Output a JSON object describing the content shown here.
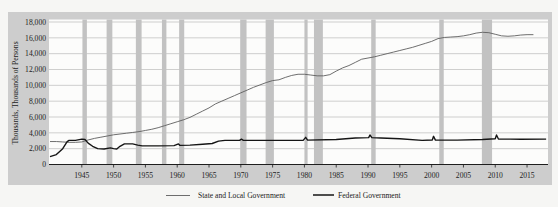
{
  "chart_data": {
    "type": "line",
    "title": "",
    "xlabel": "",
    "ylabel": "Thousands, Thousands of Persons",
    "xlim": [
      1940,
      2018.2
    ],
    "ylim": [
      0,
      18000
    ],
    "xticks": [
      1945,
      1950,
      1955,
      1960,
      1965,
      1970,
      1975,
      1980,
      1985,
      1990,
      1995,
      2000,
      2005,
      2010,
      2015
    ],
    "xtick_labels": [
      "1945",
      "1950",
      "1955",
      "1960",
      "1965",
      "1970",
      "1975",
      "1980",
      "1985",
      "1990",
      "1995",
      "2000",
      "2005",
      "2010",
      "2015"
    ],
    "yticks": [
      0,
      2000,
      4000,
      6000,
      8000,
      10000,
      12000,
      14000,
      16000,
      18000
    ],
    "ytick_labels": [
      "0",
      "2,000",
      "4,000",
      "6,000",
      "8,000",
      "10,000",
      "12,000",
      "14,000",
      "16,000",
      "18,000"
    ],
    "grid": "horizontal",
    "legend_position": "bottom",
    "shaded_bands": [
      [
        1945.1,
        1945.8
      ],
      [
        1948.9,
        1949.8
      ],
      [
        1953.5,
        1954.4
      ],
      [
        1957.6,
        1958.3
      ],
      [
        1960.3,
        1961.1
      ],
      [
        1969.9,
        1970.9
      ],
      [
        1973.9,
        1975.2
      ],
      [
        1980.0,
        1980.5
      ],
      [
        1981.5,
        1982.9
      ],
      [
        1990.5,
        1991.2
      ],
      [
        2001.2,
        2001.9
      ],
      [
        2007.9,
        2009.5
      ]
    ],
    "series": [
      {
        "name": "State and Local Government",
        "color": "#5e5e5e",
        "x": [
          1940,
          1941,
          1942,
          1943,
          1944,
          1945,
          1946,
          1947,
          1948,
          1949,
          1950,
          1951,
          1952,
          1953,
          1954,
          1955,
          1956,
          1957,
          1958,
          1959,
          1960,
          1961,
          1962,
          1963,
          1964,
          1965,
          1966,
          1967,
          1968,
          1969,
          1970,
          1971,
          1972,
          1973,
          1974,
          1975,
          1976,
          1977,
          1978,
          1979,
          1980,
          1981,
          1982,
          1983,
          1984,
          1985,
          1986,
          1987,
          1988,
          1989,
          1990,
          1991,
          1992,
          1993,
          1994,
          1995,
          1996,
          1997,
          1998,
          1999,
          2000,
          2001,
          2002,
          2003,
          2004,
          2005,
          2006,
          2007,
          2008,
          2009,
          2010,
          2011,
          2012,
          2013,
          2014,
          2015,
          2016
        ],
        "values": [
          2900,
          2900,
          2850,
          2800,
          2800,
          2850,
          3100,
          3300,
          3450,
          3600,
          3750,
          3850,
          3950,
          4050,
          4150,
          4300,
          4450,
          4650,
          4900,
          5150,
          5400,
          5650,
          5950,
          6350,
          6750,
          7150,
          7650,
          8000,
          8350,
          8700,
          9050,
          9400,
          9750,
          10050,
          10350,
          10600,
          10700,
          11000,
          11250,
          11400,
          11400,
          11300,
          11200,
          11200,
          11350,
          11800,
          12200,
          12500,
          12900,
          13300,
          13450,
          13600,
          13800,
          14000,
          14200,
          14400,
          14600,
          14800,
          15050,
          15300,
          15550,
          15900,
          16050,
          16100,
          16150,
          16250,
          16400,
          16600,
          16700,
          16650,
          16450,
          16250,
          16200,
          16250,
          16350,
          16400,
          16400
        ]
      },
      {
        "name": "Federal Government",
        "color": "#151515",
        "x": [
          1940,
          1941,
          1942,
          1942.7,
          1943,
          1944,
          1945,
          1945.5,
          1946,
          1946.7,
          1947.5,
          1948.5,
          1949.5,
          1950,
          1950.5,
          1951,
          1951.7,
          1953,
          1953.8,
          1954.5,
          1957,
          1959.5,
          1960.2,
          1960.4,
          1962,
          1964,
          1965.5,
          1966.5,
          1967.5,
          1969.8,
          1970.1,
          1970.4,
          1975,
          1979.8,
          1980.2,
          1980.5,
          1985,
          1988,
          1990.1,
          1990.3,
          1990.6,
          1992,
          1995,
          1998.5,
          2000.1,
          2000.3,
          2000.6,
          2004,
          2008,
          2010.0,
          2010.2,
          2010.5,
          2014,
          2018
        ],
        "values": [
          1000,
          1250,
          2000,
          2900,
          3050,
          3050,
          3200,
          3150,
          2700,
          2300,
          2000,
          1950,
          2100,
          2000,
          1950,
          2300,
          2600,
          2600,
          2450,
          2350,
          2350,
          2380,
          2600,
          2420,
          2450,
          2550,
          2650,
          2950,
          3050,
          3050,
          3200,
          3050,
          3050,
          3050,
          3430,
          3080,
          3150,
          3350,
          3400,
          3730,
          3400,
          3350,
          3250,
          3050,
          3100,
          3560,
          3080,
          3080,
          3150,
          3250,
          3730,
          3230,
          3180,
          3200
        ]
      }
    ]
  },
  "legend": {
    "items": [
      {
        "label": "State and Local Government",
        "color": "#5e5e5e",
        "style": "thin"
      },
      {
        "label": "Federal Government",
        "color": "#151515",
        "style": "thick"
      }
    ]
  },
  "colors": {
    "page_background": "#f6f6f4",
    "frame": "#cdcdcd",
    "plot_background": "#fcfcfb",
    "gridline": "#c3c3c3",
    "shaded_band": "#c2c2c2",
    "axis": "#1e1e1e"
  }
}
